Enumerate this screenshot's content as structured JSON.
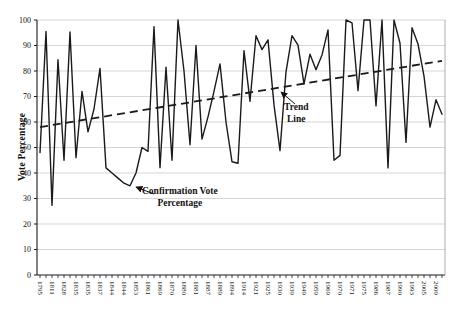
{
  "chart_data": {
    "type": "line",
    "title": "",
    "ylabel": "Vote Percentage",
    "xlabel": "",
    "ylim": [
      0,
      100
    ],
    "yticks": [
      0,
      10,
      20,
      30,
      40,
      50,
      60,
      70,
      80,
      90,
      100
    ],
    "grid": "horizontal",
    "x_tick_labels": [
      "1795",
      "1811",
      "1828",
      "1835",
      "1835",
      "1837",
      "1844",
      "1844",
      "1853",
      "1861",
      "1869",
      "1870",
      "1880",
      "1881",
      "1887",
      "1889",
      "1894",
      "1914",
      "1921",
      "1925",
      "1930",
      "1939",
      "1949",
      "1959",
      "1969",
      "1970",
      "1971",
      "1975",
      "1986",
      "1987",
      "1990",
      "1993",
      "2005",
      "2009"
    ],
    "label_every_n_points": 2,
    "series": [
      {
        "name": "Confirmation Vote Percentage",
        "color": "#1a1a1a",
        "values": [
          48,
          95.5,
          27.3,
          84.4,
          45,
          95.3,
          46,
          72,
          56.1,
          65.1,
          81,
          42,
          40,
          38,
          36,
          35,
          40,
          50,
          48.5,
          97.4,
          42.1,
          81.5,
          45,
          100,
          80,
          51.1,
          90,
          53.3,
          62,
          72,
          82.8,
          60,
          44.4,
          43.8,
          88,
          68.1,
          93.8,
          88.4,
          92.2,
          66.7,
          48.8,
          79.7,
          93.9,
          90.1,
          75,
          86.6,
          80.5,
          86.3,
          96.1,
          45,
          46.9,
          100,
          98.9,
          72.3,
          100,
          100,
          66.3,
          100,
          42,
          100,
          90.9,
          52,
          97,
          90.6,
          78,
          58,
          68.7,
          63
        ]
      }
    ],
    "trend": {
      "name": "Trend Line",
      "style": "dashed",
      "color": "#1a1a1a",
      "start_value": 58,
      "end_value": 84
    },
    "annotations": [
      {
        "id": "series-callout",
        "line1": "Confirmation Vote",
        "line2": "Percentage"
      },
      {
        "id": "trend-callout",
        "line1": "Trend",
        "line2": "Line"
      }
    ],
    "legend": "none",
    "colors": {
      "grid": "#c4c4c4",
      "axis": "#1a1a1a",
      "text": "#111111",
      "background": "#ffffff"
    }
  }
}
